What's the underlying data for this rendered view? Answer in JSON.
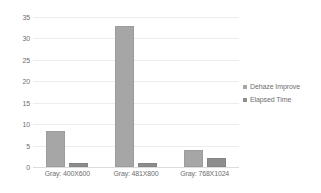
{
  "chart_data": {
    "type": "bar",
    "title": "",
    "xlabel": "",
    "ylabel": "",
    "ylim": [
      0,
      35
    ],
    "yticks": [
      0,
      5,
      10,
      15,
      20,
      25,
      30,
      35
    ],
    "grid": true,
    "legend_position": "right",
    "categories": [
      "Gray: 400X600",
      "Gray: 481X800",
      "Gray: 768X1024"
    ],
    "series": [
      {
        "name": "Dehaze Improve",
        "color": "#a6a6a6",
        "values": [
          8.4,
          33,
          4
        ]
      },
      {
        "name": "Elapsed Time",
        "color": "#8d8d8d",
        "values": [
          1,
          1,
          2.1
        ]
      }
    ]
  }
}
